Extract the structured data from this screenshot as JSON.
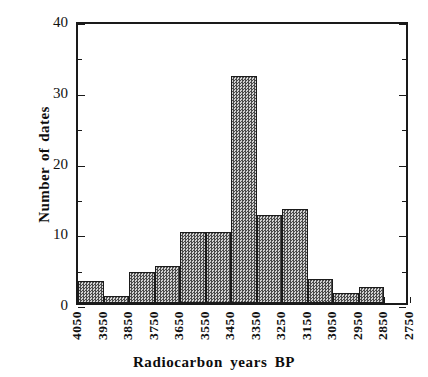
{
  "chart_data": {
    "type": "bar",
    "title": "",
    "subtitle": "",
    "xlabel": "Radiocarbon years BP",
    "ylabel": "Number of dates",
    "categories": [
      "4050-3950",
      "3950-3850",
      "3850-3750",
      "3750-3650",
      "3650-3550",
      "3550-3450",
      "3450-3350",
      "3350-3250",
      "3250-3150",
      "3150-3050",
      "3050-2950",
      "2950-2850",
      "2850-2750"
    ],
    "values": [
      3.1,
      1.0,
      4.4,
      5.2,
      10.1,
      10.1,
      32.1,
      12.4,
      13.3,
      3.4,
      1.4,
      2.3,
      0
    ],
    "x_tick_labels": [
      "4050",
      "3950",
      "3850",
      "3750",
      "3650",
      "3550",
      "3450",
      "3350",
      "3250",
      "3150",
      "3050",
      "2950",
      "2850",
      "2750"
    ],
    "y_tick_labels": [
      "0",
      "10",
      "20",
      "30",
      "40"
    ],
    "y_major_ticks": [
      0,
      10,
      20,
      30,
      40
    ],
    "y_minor_ticks": [
      5,
      15,
      25,
      35
    ],
    "ylim": [
      0,
      40
    ],
    "grid": false,
    "legend": false,
    "legend_position": "none",
    "bar_fill_color": "#8d8d8d",
    "bar_edge_color": "#1b1b1b",
    "axis_color": "#1a1a1a",
    "background_color": "#ffffff"
  }
}
